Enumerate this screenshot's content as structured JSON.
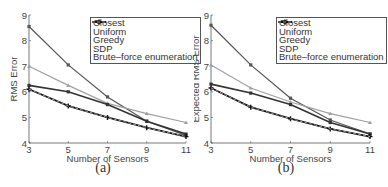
{
  "chart_data": [
    {
      "type": "line",
      "panel_label": "(a)",
      "title": "",
      "xlabel": "Number of Sensors",
      "ylabel": "RMS Error",
      "x": [
        3,
        5,
        7,
        9,
        11
      ],
      "xticks": [
        "3",
        "5",
        "7",
        "9",
        "11"
      ],
      "yticks": [
        "4",
        "5",
        "6",
        "7",
        "8",
        "9"
      ],
      "xlim": [
        3,
        11
      ],
      "ylim": [
        4,
        9
      ],
      "grid": false,
      "legend_position": "upper right",
      "series": [
        {
          "name": "Closest",
          "values": [
            8.55,
            7.05,
            5.8,
            4.85,
            4.3
          ],
          "color": "#555555",
          "marker": "square",
          "style": "solid",
          "width": 1.2
        },
        {
          "name": "Uniform",
          "values": [
            7.0,
            6.25,
            5.55,
            5.15,
            4.8
          ],
          "color": "#a0a0a0",
          "marker": "triangle",
          "style": "solid",
          "width": 1.2
        },
        {
          "name": "Greedy",
          "values": [
            6.25,
            6.0,
            5.5,
            4.85,
            4.35
          ],
          "color": "#333333",
          "marker": "square",
          "style": "solid",
          "width": 1.6
        },
        {
          "name": "SDP",
          "values": [
            6.1,
            5.45,
            5.0,
            4.6,
            4.25
          ],
          "color": "#111111",
          "marker": "plus",
          "style": "solid",
          "width": 1.8
        },
        {
          "name": "Brute–force enumeration",
          "values": [
            6.1,
            5.45,
            5.0,
            4.6,
            4.25
          ],
          "color": "#999999",
          "marker": "none",
          "style": "dashed",
          "width": 1.0
        }
      ]
    },
    {
      "type": "line",
      "panel_label": "(b)",
      "title": "",
      "xlabel": "Number of Sensors",
      "ylabel": "Expected RMS Error",
      "x": [
        3,
        5,
        7,
        9,
        11
      ],
      "xticks": [
        "3",
        "5",
        "7",
        "9",
        "11"
      ],
      "yticks": [
        "4",
        "5",
        "6",
        "7",
        "8",
        "9"
      ],
      "xlim": [
        3,
        11
      ],
      "ylim": [
        4,
        9
      ],
      "grid": false,
      "legend_position": "upper right",
      "series": [
        {
          "name": "Closest",
          "values": [
            8.6,
            7.05,
            5.75,
            4.9,
            4.35
          ],
          "color": "#555555",
          "marker": "square",
          "style": "solid",
          "width": 1.2
        },
        {
          "name": "Uniform",
          "values": [
            7.05,
            6.15,
            5.6,
            5.15,
            4.8
          ],
          "color": "#a0a0a0",
          "marker": "triangle",
          "style": "solid",
          "width": 1.2
        },
        {
          "name": "Greedy",
          "values": [
            6.3,
            5.95,
            5.5,
            4.8,
            4.35
          ],
          "color": "#333333",
          "marker": "square",
          "style": "solid",
          "width": 1.6
        },
        {
          "name": "SDP",
          "values": [
            6.15,
            5.4,
            4.95,
            4.55,
            4.25
          ],
          "color": "#111111",
          "marker": "plus",
          "style": "solid",
          "width": 1.8
        },
        {
          "name": "Brute–force enumeration",
          "values": [
            6.15,
            5.4,
            4.95,
            4.55,
            4.25
          ],
          "color": "#999999",
          "marker": "none",
          "style": "dashed",
          "width": 1.0
        }
      ]
    }
  ],
  "panels": [
    {
      "caption": "(a)",
      "ylabel": "RMS Error",
      "xlabel": "Number of Sensors"
    },
    {
      "caption": "(b)",
      "ylabel": "Expected RMS Error",
      "xlabel": "Number of Sensors"
    }
  ],
  "legend": {
    "items": [
      "Closest",
      "Uniform",
      "Greedy",
      "SDP",
      "Brute–force enumeration"
    ]
  }
}
